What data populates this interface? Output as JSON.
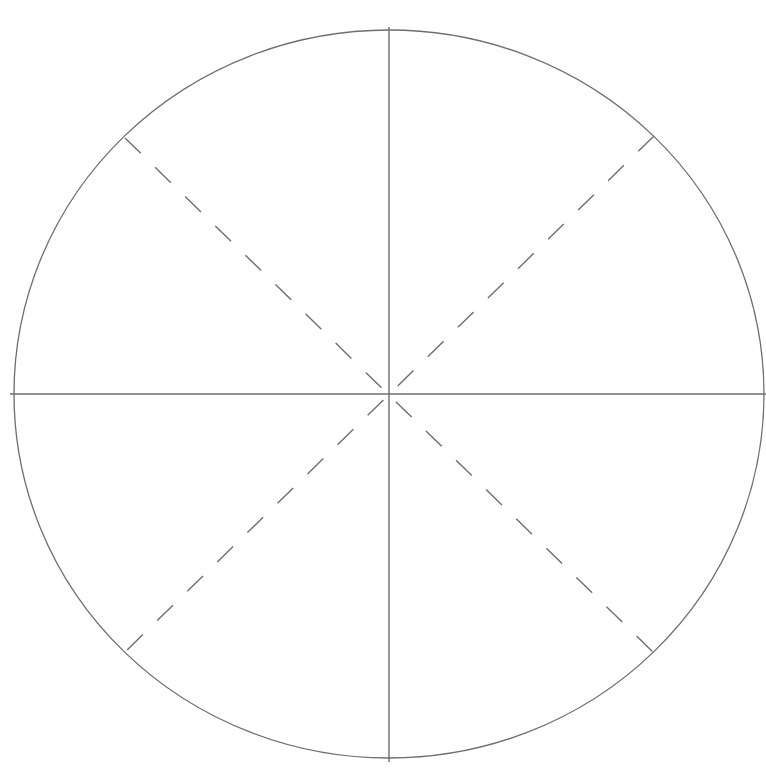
{
  "diagram": {
    "type": "circle-divided-into-eighths",
    "stroke_color": "#6e6e6e",
    "circle": {
      "cx": 389,
      "cy": 394,
      "rx": 375,
      "ry": 364
    },
    "solid_lines": [
      {
        "name": "vertical-axis",
        "x1": 389,
        "y1": 27,
        "x2": 389,
        "y2": 762
      },
      {
        "name": "horizontal-axis",
        "x1": 10,
        "y1": 394,
        "x2": 766,
        "y2": 394
      }
    ],
    "dashed_lines": [
      {
        "name": "diagonal-nw-se",
        "x1": 125,
        "y1": 138,
        "x2": 654,
        "y2": 653
      },
      {
        "name": "diagonal-ne-sw",
        "x1": 654,
        "y1": 136,
        "x2": 125,
        "y2": 652
      }
    ]
  }
}
